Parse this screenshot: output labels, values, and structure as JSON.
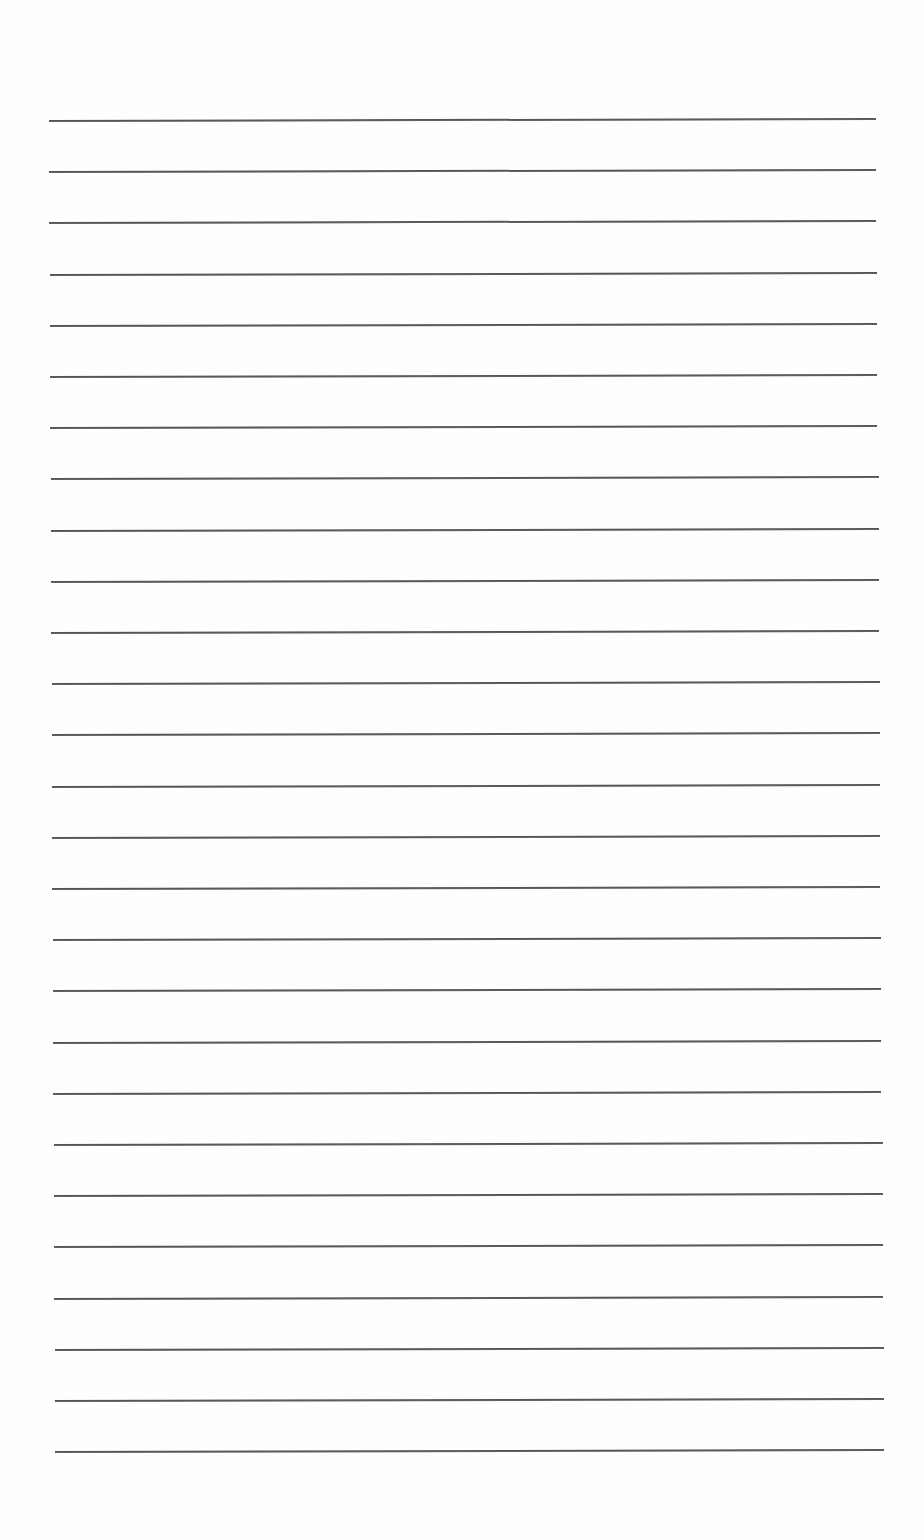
{
  "page": {
    "type": "blank-lined-paper",
    "line_count": 27,
    "first_line_y": 120,
    "line_spacing": 51.2,
    "line_color": "#555555",
    "background": "#fefefe"
  }
}
